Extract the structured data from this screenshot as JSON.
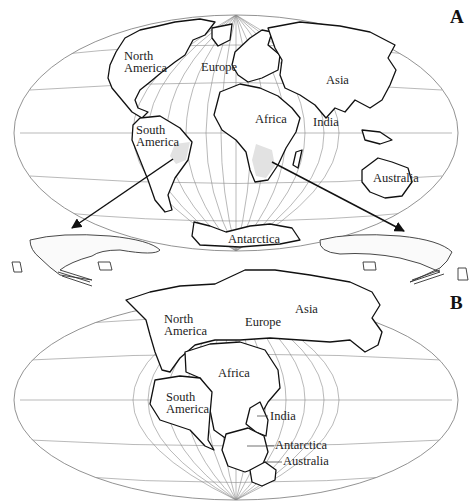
{
  "figure": {
    "panels": [
      {
        "id": "A",
        "label": "A",
        "caption_state": "Present-day continent positions",
        "continent_labels": {
          "north_america": [
            "North",
            "America"
          ],
          "europe": "Europe",
          "asia": "Asia",
          "africa": "Africa",
          "india": "India",
          "south_america": [
            "South",
            "America"
          ],
          "australia": "Australia",
          "antarctica": "Antarctica"
        },
        "fossil_regions": [
          "Eastern Brazil (South America)",
          "Southern Africa"
        ],
        "arrows": [
          "South America fossil region to left Mesosaurus",
          "Africa fossil region to right Mesosaurus"
        ]
      },
      {
        "id": "B",
        "label": "B",
        "caption_state": "Continents joined in Pangaea",
        "continent_labels": {
          "north_america": [
            "North",
            "America"
          ],
          "europe": "Europe",
          "asia": "Asia",
          "africa": "Africa",
          "south_america": [
            "South",
            "America"
          ],
          "india": "India",
          "antarctica": "Antarctica",
          "australia": "Australia"
        }
      }
    ],
    "illustrations": [
      {
        "name": "mesosaurus-left",
        "side": "left"
      },
      {
        "name": "mesosaurus-right",
        "side": "right"
      }
    ],
    "colors": {
      "outline": "#111111",
      "grid": "#8a8a8a",
      "fossil_fill": "#e2e2e2",
      "background": "#ffffff"
    }
  }
}
